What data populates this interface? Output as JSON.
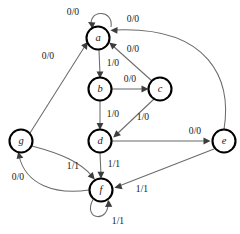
{
  "diagram": {
    "type": "finite-state-machine",
    "title": "",
    "canvas": {
      "width": 240,
      "height": 234,
      "background": "#ffffff"
    },
    "style": {
      "node_stroke": "#000000",
      "node_fill": "#ffffff",
      "edge_stroke": "#6b6b6b",
      "arrow_fill": "#3d3d3d",
      "label_color": "#1a1a1a",
      "node_radius": 11.5
    },
    "nodes": [
      {
        "id": "a",
        "label": "a",
        "x": 98,
        "y": 38
      },
      {
        "id": "b",
        "label": "b",
        "x": 100,
        "y": 89
      },
      {
        "id": "c",
        "label": "c",
        "x": 160,
        "y": 89
      },
      {
        "id": "d",
        "label": "d",
        "x": 100,
        "y": 141
      },
      {
        "id": "e",
        "label": "e",
        "x": 224,
        "y": 141
      },
      {
        "id": "f",
        "label": "f",
        "x": 101,
        "y": 190
      },
      {
        "id": "g",
        "label": "g",
        "x": 21,
        "y": 141
      }
    ],
    "edges": [
      {
        "id": "a-a",
        "from": "a",
        "to": "a",
        "label": "0/0",
        "label_x": 73,
        "label_y": 13
      },
      {
        "id": "a-b",
        "from": "a",
        "to": "b",
        "label": "1/0",
        "label_x": 113,
        "label_y": 64
      },
      {
        "id": "b-c",
        "from": "b",
        "to": "c",
        "label": "0/0",
        "label_x": 130,
        "label_y": 80
      },
      {
        "id": "b-d",
        "from": "b",
        "to": "d",
        "label": "1/0",
        "label_x": 113,
        "label_y": 115
      },
      {
        "id": "c-a",
        "from": "c",
        "to": "a",
        "label": "0/0",
        "label_x": 133,
        "label_y": 50
      },
      {
        "id": "c-d",
        "from": "c",
        "to": "d",
        "label": "1/0",
        "label_x": 143,
        "label_y": 118
      },
      {
        "id": "d-e",
        "from": "d",
        "to": "e",
        "label": "0/0",
        "label_x": 195,
        "label_y": 132
      },
      {
        "id": "d-f",
        "from": "d",
        "to": "f",
        "label": "1/1",
        "label_x": 114,
        "label_y": 165
      },
      {
        "id": "e-a",
        "from": "e",
        "to": "a",
        "label": "0/0",
        "label_x": 133,
        "label_y": 20
      },
      {
        "id": "e-f",
        "from": "e",
        "to": "f",
        "label": "1/1",
        "label_x": 142,
        "label_y": 190
      },
      {
        "id": "f-f",
        "from": "f",
        "to": "f",
        "label": "1/1",
        "label_x": 118,
        "label_y": 222
      },
      {
        "id": "f-g",
        "from": "f",
        "to": "g",
        "label": "0/0",
        "label_x": 18,
        "label_y": 178
      },
      {
        "id": "g-a",
        "from": "g",
        "to": "a",
        "label": "0/0",
        "label_x": 48,
        "label_y": 57
      },
      {
        "id": "g-f",
        "from": "g",
        "to": "f",
        "label": "1/1",
        "label_x": 73,
        "label_y": 167
      }
    ]
  }
}
